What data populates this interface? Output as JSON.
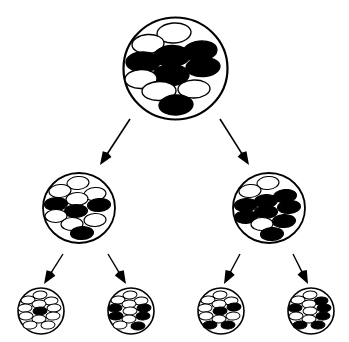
{
  "figure": {
    "background_color": "#ffffff",
    "stroke_color": "#000000",
    "cell_fill_white": "#ffffff",
    "cell_fill_black": "#000000",
    "generations": 3,
    "total_populations": 7,
    "total_arrows": 6
  },
  "chart_data": {
    "type": "diagram",
    "legend": [
      {
        "name": "white-cell",
        "fill": "#ffffff",
        "stroke": "#000000"
      },
      {
        "name": "black-cell",
        "fill": "#000000",
        "stroke": "#000000"
      }
    ],
    "populations": [
      {
        "id": "gen1-root",
        "generation": 1,
        "cx": 175.5,
        "cy": 68.5,
        "rx": 52,
        "ry": 51,
        "stroke_width": 2.2,
        "cell_count": 11,
        "white_count": 6,
        "black_count": 5,
        "black_fraction": 0.45,
        "cells": [
          {
            "cx": 174,
            "cy": 33,
            "rx": 17,
            "ry": 10,
            "angle": -4,
            "type": "white"
          },
          {
            "cx": 148,
            "cy": 44,
            "rx": 16,
            "ry": 9.5,
            "angle": -4,
            "type": "white"
          },
          {
            "cx": 200,
            "cy": 51,
            "rx": 17,
            "ry": 10,
            "angle": -6,
            "type": "black"
          },
          {
            "cx": 172,
            "cy": 56,
            "rx": 18,
            "ry": 10.5,
            "angle": -2,
            "type": "black"
          },
          {
            "cx": 143,
            "cy": 62,
            "rx": 17,
            "ry": 10,
            "angle": -1,
            "type": "black"
          },
          {
            "cx": 203,
            "cy": 67,
            "rx": 17,
            "ry": 9.5,
            "angle": -3,
            "type": "black"
          },
          {
            "cx": 171,
            "cy": 75,
            "rx": 18,
            "ry": 10.5,
            "angle": -1,
            "type": "black"
          },
          {
            "cx": 141,
            "cy": 79,
            "rx": 16,
            "ry": 9.5,
            "angle": -2,
            "type": "white"
          },
          {
            "cx": 194,
            "cy": 89,
            "rx": 16,
            "ry": 9,
            "angle": -2,
            "type": "white"
          },
          {
            "cx": 159,
            "cy": 91,
            "rx": 17,
            "ry": 9.5,
            "angle": -2,
            "type": "white"
          },
          {
            "cx": 176,
            "cy": 105,
            "rx": 17,
            "ry": 10,
            "angle": -3,
            "type": "black"
          }
        ]
      },
      {
        "id": "gen2-left",
        "generation": 2,
        "cx": 79,
        "cy": 208,
        "rx": 36,
        "ry": 35,
        "stroke_width": 1.8,
        "cell_count": 11,
        "white_count": 7,
        "black_count": 4,
        "black_fraction": 0.36,
        "cells": [
          {
            "cx": 78,
            "cy": 183,
            "rx": 11,
            "ry": 6.5,
            "angle": -5,
            "type": "white"
          },
          {
            "cx": 60,
            "cy": 191,
            "rx": 11,
            "ry": 6.5,
            "angle": -5,
            "type": "white"
          },
          {
            "cx": 95,
            "cy": 194,
            "rx": 11,
            "ry": 6.5,
            "angle": -5,
            "type": "white"
          },
          {
            "cx": 77,
            "cy": 199,
            "rx": 11,
            "ry": 6.5,
            "angle": -3,
            "type": "white"
          },
          {
            "cx": 56,
            "cy": 204,
            "rx": 11.5,
            "ry": 6.5,
            "angle": -3,
            "type": "black"
          },
          {
            "cx": 99,
            "cy": 205,
            "rx": 11.5,
            "ry": 6.5,
            "angle": -4,
            "type": "black"
          },
          {
            "cx": 76,
            "cy": 211,
            "rx": 11.5,
            "ry": 6.5,
            "angle": -2,
            "type": "black"
          },
          {
            "cx": 56,
            "cy": 216,
            "rx": 11,
            "ry": 6.5,
            "angle": -2,
            "type": "white"
          },
          {
            "cx": 95,
            "cy": 220,
            "rx": 11,
            "ry": 6.5,
            "angle": -3,
            "type": "white"
          },
          {
            "cx": 72,
            "cy": 224,
            "rx": 11,
            "ry": 6.5,
            "angle": -2,
            "type": "white"
          },
          {
            "cx": 82,
            "cy": 233,
            "rx": 11.5,
            "ry": 6.5,
            "angle": -3,
            "type": "black"
          }
        ]
      },
      {
        "id": "gen2-right",
        "generation": 2,
        "cx": 269,
        "cy": 208,
        "rx": 36,
        "ry": 35,
        "stroke_width": 1.8,
        "cell_count": 11,
        "white_count": 3,
        "black_count": 8,
        "black_fraction": 0.73,
        "cells": [
          {
            "cx": 268,
            "cy": 183,
            "rx": 11,
            "ry": 6.5,
            "angle": -5,
            "type": "white"
          },
          {
            "cx": 250,
            "cy": 191,
            "rx": 11,
            "ry": 6.5,
            "angle": -5,
            "type": "white"
          },
          {
            "cx": 285,
            "cy": 196,
            "rx": 11.5,
            "ry": 6.5,
            "angle": -5,
            "type": "black"
          },
          {
            "cx": 266,
            "cy": 201,
            "rx": 11.5,
            "ry": 6.5,
            "angle": -3,
            "type": "black"
          },
          {
            "cx": 246,
            "cy": 205,
            "rx": 11.5,
            "ry": 6.5,
            "angle": -3,
            "type": "black"
          },
          {
            "cx": 289,
            "cy": 207,
            "rx": 11.5,
            "ry": 6.5,
            "angle": -4,
            "type": "black"
          },
          {
            "cx": 266,
            "cy": 212,
            "rx": 11.5,
            "ry": 6.5,
            "angle": -2,
            "type": "black"
          },
          {
            "cx": 246,
            "cy": 217,
            "rx": 11.5,
            "ry": 6.5,
            "angle": -2,
            "type": "black"
          },
          {
            "cx": 284,
            "cy": 221,
            "rx": 11.5,
            "ry": 6.5,
            "angle": -3,
            "type": "black"
          },
          {
            "cx": 262,
            "cy": 224,
            "rx": 11,
            "ry": 6.5,
            "angle": -2,
            "type": "white"
          },
          {
            "cx": 272,
            "cy": 234,
            "rx": 11.5,
            "ry": 6.5,
            "angle": -3,
            "type": "black"
          }
        ]
      },
      {
        "id": "gen3-a",
        "generation": 3,
        "cx": 41,
        "cy": 311,
        "rx": 23,
        "ry": 23,
        "stroke_width": 1.6,
        "cell_count": 12,
        "white_count": 11,
        "black_count": 1,
        "black_fraction": 0.08,
        "cells": [
          {
            "cx": 40,
            "cy": 295,
            "rx": 7,
            "ry": 4,
            "angle": -5,
            "type": "white"
          },
          {
            "cx": 28,
            "cy": 300,
            "rx": 7,
            "ry": 4,
            "angle": -5,
            "type": "white"
          },
          {
            "cx": 51,
            "cy": 301,
            "rx": 7,
            "ry": 4,
            "angle": -5,
            "type": "white"
          },
          {
            "cx": 39,
            "cy": 304,
            "rx": 7,
            "ry": 4,
            "angle": -3,
            "type": "white"
          },
          {
            "cx": 25,
            "cy": 308,
            "rx": 7,
            "ry": 4,
            "angle": -3,
            "type": "white"
          },
          {
            "cx": 54,
            "cy": 308,
            "rx": 7,
            "ry": 4,
            "angle": -4,
            "type": "white"
          },
          {
            "cx": 40,
            "cy": 311,
            "rx": 7,
            "ry": 4,
            "angle": -2,
            "type": "black"
          },
          {
            "cx": 26,
            "cy": 316,
            "rx": 7,
            "ry": 4,
            "angle": -2,
            "type": "white"
          },
          {
            "cx": 53,
            "cy": 316,
            "rx": 7,
            "ry": 4,
            "angle": -3,
            "type": "white"
          },
          {
            "cx": 39,
            "cy": 319,
            "rx": 7,
            "ry": 4,
            "angle": -2,
            "type": "white"
          },
          {
            "cx": 30,
            "cy": 325,
            "rx": 7,
            "ry": 4,
            "angle": -3,
            "type": "white"
          },
          {
            "cx": 48,
            "cy": 325,
            "rx": 7,
            "ry": 4,
            "angle": -3,
            "type": "white"
          }
        ]
      },
      {
        "id": "gen3-b",
        "generation": 3,
        "cx": 131,
        "cy": 311,
        "rx": 23,
        "ry": 23,
        "stroke_width": 1.6,
        "cell_count": 12,
        "white_count": 7,
        "black_count": 5,
        "black_fraction": 0.42,
        "cells": [
          {
            "cx": 130,
            "cy": 295,
            "rx": 7,
            "ry": 4,
            "angle": -5,
            "type": "white"
          },
          {
            "cx": 118,
            "cy": 300,
            "rx": 7,
            "ry": 4,
            "angle": -5,
            "type": "white"
          },
          {
            "cx": 141,
            "cy": 301,
            "rx": 7,
            "ry": 4,
            "angle": -5,
            "type": "white"
          },
          {
            "cx": 129,
            "cy": 304,
            "rx": 7,
            "ry": 4,
            "angle": -3,
            "type": "white"
          },
          {
            "cx": 115,
            "cy": 308,
            "rx": 7,
            "ry": 4,
            "angle": -3,
            "type": "black"
          },
          {
            "cx": 144,
            "cy": 308,
            "rx": 7,
            "ry": 4,
            "angle": -4,
            "type": "black"
          },
          {
            "cx": 130,
            "cy": 311,
            "rx": 7,
            "ry": 4,
            "angle": -2,
            "type": "white"
          },
          {
            "cx": 116,
            "cy": 316,
            "rx": 7,
            "ry": 4,
            "angle": -2,
            "type": "black"
          },
          {
            "cx": 143,
            "cy": 316,
            "rx": 7,
            "ry": 4,
            "angle": -3,
            "type": "black"
          },
          {
            "cx": 129,
            "cy": 319,
            "rx": 7,
            "ry": 4,
            "angle": -2,
            "type": "white"
          },
          {
            "cx": 120,
            "cy": 325,
            "rx": 7,
            "ry": 4,
            "angle": -3,
            "type": "white"
          },
          {
            "cx": 138,
            "cy": 326,
            "rx": 7,
            "ry": 4,
            "angle": -3,
            "type": "black"
          }
        ]
      },
      {
        "id": "gen3-c",
        "generation": 3,
        "cx": 221,
        "cy": 311,
        "rx": 23,
        "ry": 23,
        "stroke_width": 1.6,
        "cell_count": 12,
        "white_count": 8,
        "black_count": 4,
        "black_fraction": 0.33,
        "cells": [
          {
            "cx": 220,
            "cy": 295,
            "rx": 7,
            "ry": 4,
            "angle": -5,
            "type": "white"
          },
          {
            "cx": 208,
            "cy": 300,
            "rx": 7,
            "ry": 4,
            "angle": -5,
            "type": "white"
          },
          {
            "cx": 231,
            "cy": 301,
            "rx": 7,
            "ry": 4,
            "angle": -5,
            "type": "white"
          },
          {
            "cx": 219,
            "cy": 304,
            "rx": 7,
            "ry": 4,
            "angle": -3,
            "type": "white"
          },
          {
            "cx": 205,
            "cy": 308,
            "rx": 7,
            "ry": 4,
            "angle": -3,
            "type": "white"
          },
          {
            "cx": 234,
            "cy": 307,
            "rx": 7,
            "ry": 4,
            "angle": -4,
            "type": "black"
          },
          {
            "cx": 220,
            "cy": 311,
            "rx": 7,
            "ry": 4,
            "angle": -2,
            "type": "black"
          },
          {
            "cx": 206,
            "cy": 316,
            "rx": 7,
            "ry": 4,
            "angle": -2,
            "type": "white"
          },
          {
            "cx": 233,
            "cy": 316,
            "rx": 7,
            "ry": 4,
            "angle": -3,
            "type": "white"
          },
          {
            "cx": 219,
            "cy": 319,
            "rx": 7,
            "ry": 4,
            "angle": -2,
            "type": "white"
          },
          {
            "cx": 210,
            "cy": 325,
            "rx": 7,
            "ry": 4,
            "angle": -3,
            "type": "black"
          },
          {
            "cx": 228,
            "cy": 325,
            "rx": 7,
            "ry": 4,
            "angle": -3,
            "type": "black"
          }
        ]
      },
      {
        "id": "gen3-d",
        "generation": 3,
        "cx": 311,
        "cy": 311,
        "rx": 23,
        "ry": 23,
        "stroke_width": 1.6,
        "cell_count": 12,
        "white_count": 6,
        "black_count": 6,
        "black_fraction": 0.5,
        "cells": [
          {
            "cx": 310,
            "cy": 295,
            "rx": 7,
            "ry": 4,
            "angle": -5,
            "type": "white"
          },
          {
            "cx": 298,
            "cy": 300,
            "rx": 7,
            "ry": 4,
            "angle": -5,
            "type": "white"
          },
          {
            "cx": 321,
            "cy": 301,
            "rx": 7,
            "ry": 4,
            "angle": -5,
            "type": "black"
          },
          {
            "cx": 309,
            "cy": 304,
            "rx": 7,
            "ry": 4,
            "angle": -3,
            "type": "white"
          },
          {
            "cx": 295,
            "cy": 308,
            "rx": 7,
            "ry": 4,
            "angle": -3,
            "type": "black"
          },
          {
            "cx": 324,
            "cy": 308,
            "rx": 7,
            "ry": 4,
            "angle": -4,
            "type": "black"
          },
          {
            "cx": 310,
            "cy": 311,
            "rx": 7,
            "ry": 4,
            "angle": -2,
            "type": "white"
          },
          {
            "cx": 296,
            "cy": 316,
            "rx": 7,
            "ry": 4,
            "angle": -2,
            "type": "white"
          },
          {
            "cx": 323,
            "cy": 316,
            "rx": 7,
            "ry": 4,
            "angle": -3,
            "type": "black"
          },
          {
            "cx": 309,
            "cy": 319,
            "rx": 7,
            "ry": 4,
            "angle": -2,
            "type": "white"
          },
          {
            "cx": 300,
            "cy": 325,
            "rx": 7,
            "ry": 4,
            "angle": -3,
            "type": "black"
          },
          {
            "cx": 318,
            "cy": 325,
            "rx": 7,
            "ry": 4,
            "angle": -3,
            "type": "black"
          }
        ]
      }
    ],
    "arrows": [
      {
        "id": "arrow-root-to-left",
        "from": "gen1-root",
        "to": "gen2-left",
        "x1": 130,
        "y1": 119,
        "x2": 100,
        "y2": 165,
        "stroke_width": 1.6
      },
      {
        "id": "arrow-root-to-right",
        "from": "gen1-root",
        "to": "gen2-right",
        "x1": 220,
        "y1": 119,
        "x2": 249,
        "y2": 165,
        "stroke_width": 1.6
      },
      {
        "id": "arrow-left-to-a",
        "from": "gen2-left",
        "to": "gen3-a",
        "x1": 63,
        "y1": 254,
        "x2": 44,
        "y2": 284,
        "stroke_width": 1.4
      },
      {
        "id": "arrow-left-to-b",
        "from": "gen2-left",
        "to": "gen3-b",
        "x1": 108,
        "y1": 254,
        "x2": 126,
        "y2": 284,
        "stroke_width": 1.4
      },
      {
        "id": "arrow-right-to-c",
        "from": "gen2-right",
        "to": "gen3-c",
        "x1": 240,
        "y1": 254,
        "x2": 224,
        "y2": 284,
        "stroke_width": 1.4
      },
      {
        "id": "arrow-right-to-d",
        "from": "gen2-right",
        "to": "gen3-d",
        "x1": 293,
        "y1": 254,
        "x2": 308,
        "y2": 284,
        "stroke_width": 1.4
      }
    ]
  }
}
